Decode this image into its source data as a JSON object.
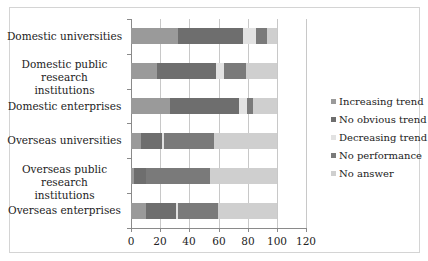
{
  "chart_data": {
    "type": "bar",
    "orientation": "horizontal",
    "stacked": true,
    "title": "",
    "xlabel": "",
    "ylabel": "",
    "xlim": [
      0,
      120
    ],
    "x_ticks": [
      "0",
      "20",
      "40",
      "60",
      "80",
      "100",
      "120"
    ],
    "grid": true,
    "legend_position": "right",
    "categories": [
      "Domestic universities",
      "Domestic public research institutions",
      "Domestic enterprises",
      "Overseas universities",
      "Overseas public research institutions",
      "Overseas enterprises"
    ],
    "category_lines": [
      [
        "Domestic universities"
      ],
      [
        "Domestic public research",
        "institutions"
      ],
      [
        "Domestic enterprises"
      ],
      [
        "Overseas universities"
      ],
      [
        "Overseas public research",
        "institutions"
      ],
      [
        "Overseas enterprises"
      ]
    ],
    "series": [
      {
        "name": "Increasing trend",
        "color": "#9a9a9a",
        "values": [
          32,
          18,
          27,
          7,
          2,
          10
        ]
      },
      {
        "name": "No obvious trend",
        "color": "#6e6e6e",
        "values": [
          45,
          40,
          47,
          14,
          8,
          21
        ]
      },
      {
        "name": "Decreasing trend",
        "color": "#e2e2e2",
        "values": [
          9,
          6,
          5.5,
          1.5,
          0,
          1.5
        ]
      },
      {
        "name": "No performance",
        "color": "#7a7a7a",
        "values": [
          7,
          15,
          4.5,
          34.5,
          44,
          27.5
        ]
      },
      {
        "name": "No answer",
        "color": "#cfcfcf",
        "values": [
          7,
          21,
          16,
          43,
          46,
          40
        ]
      }
    ]
  }
}
